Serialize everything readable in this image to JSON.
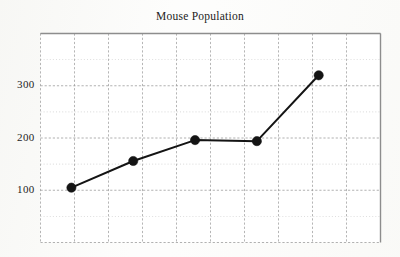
{
  "figure": {
    "title": "Mouse Population",
    "background_color": "#fdfdfc",
    "ink_color": "#1a1a1a"
  },
  "axes": {
    "y_tick_labels": [
      "100",
      "200",
      "300"
    ],
    "x_tick_labels": [],
    "x_axis_label": "",
    "y_axis_label": ""
  },
  "chart_data": {
    "type": "line",
    "title": "Mouse Population",
    "xlabel": "",
    "ylabel": "",
    "x": [
      1,
      3,
      5,
      7,
      9
    ],
    "categories": [
      "1",
      "2",
      "3",
      "4",
      "5"
    ],
    "values": [
      105,
      156,
      196,
      194,
      320
    ],
    "series": [
      {
        "name": "Mouse Population",
        "values": [
          105,
          156,
          196,
          194,
          320
        ],
        "marker": "filled-circle",
        "marker_color": "#141414",
        "line_color": "#141414"
      }
    ],
    "ylim": [
      0,
      400
    ],
    "xlim": [
      0,
      11
    ],
    "y_ticks": [
      100,
      200,
      300
    ],
    "y_gridline_step": 50,
    "x_gridline_count": 10,
    "grid": true,
    "grid_style": "dotted",
    "grid_color": "#9a9a9a",
    "legend": false,
    "legend_position": "none"
  }
}
